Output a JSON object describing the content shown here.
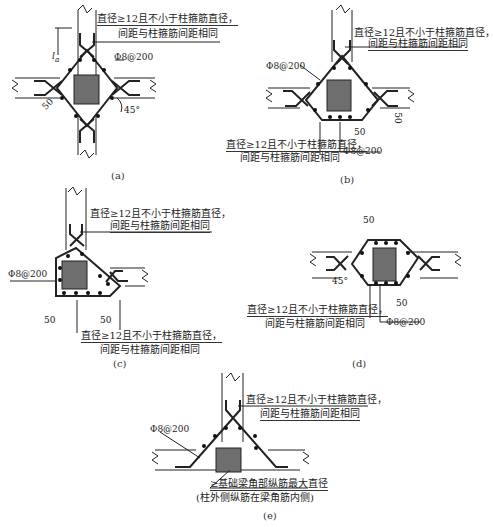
{
  "note_text": {
    "line1": "直径≥12且不小于柱箍筋直径，",
    "line2": "间距与柱箍筋间距相同"
  },
  "stirrup": "Φ8@200",
  "dim_50": "50",
  "angle_45": "45°",
  "la": "l",
  "la_sub": "a",
  "panels": [
    {
      "caption": "(a)"
    },
    {
      "caption": "(b)"
    },
    {
      "caption": "(c)"
    },
    {
      "caption": "(d)"
    },
    {
      "caption": "(e)",
      "note_line1": "≥基础梁角部纵筋最大直径",
      "note_line2": "(柱外侧纵筋在梁角筋内侧)"
    }
  ],
  "colors": {
    "line": "#222222",
    "column": "#6e6e6e"
  }
}
